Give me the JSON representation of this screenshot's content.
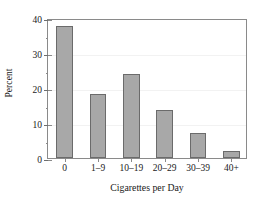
{
  "chart_data": {
    "type": "bar",
    "title": "",
    "xlabel": "Cigarettes per Day",
    "ylabel": "Percent",
    "categories": [
      "0",
      "1–9",
      "10–19",
      "20–29",
      "30–39",
      "40+"
    ],
    "values": [
      37.7,
      18.3,
      23.9,
      13.7,
      7.1,
      2.0
    ],
    "ylim": [
      0,
      40
    ],
    "y_ticks": [
      0,
      10,
      20,
      30,
      40
    ],
    "y_tick_labels": [
      "0",
      "10",
      "20",
      "30",
      "40"
    ],
    "y_minor_ticks": [
      5,
      15,
      25,
      35
    ],
    "grid": true,
    "legend": false,
    "bar_color": "#a8a8a8",
    "bar_edge_color": "#6b6b6b",
    "frame_color": "#8a8a8a",
    "gridline_color": "#f2f2f2",
    "background_color": "#ffffff"
  }
}
